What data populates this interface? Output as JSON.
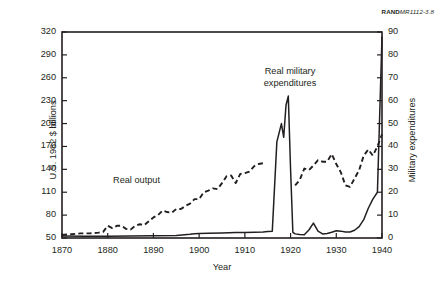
{
  "source_tag": {
    "bold": "RAND",
    "italic": "MR1112-3.8"
  },
  "chart_data": {
    "type": "line",
    "title": "",
    "xlabel": "Year",
    "ylabel": "U.S. 1982 $ billions",
    "y2label": "Military expenditures",
    "xlim": [
      1870,
      1940
    ],
    "ylim": [
      50,
      320
    ],
    "y2lim": [
      0,
      90
    ],
    "xticks": [
      1870,
      1880,
      1890,
      1900,
      1910,
      1920,
      1930,
      1940
    ],
    "yticks": [
      50,
      80,
      110,
      140,
      170,
      200,
      230,
      260,
      290,
      320
    ],
    "y2ticks": [
      0,
      10,
      20,
      30,
      40,
      50,
      60,
      70,
      80,
      90
    ],
    "grid": false,
    "legend": "annotations",
    "annotations": [
      {
        "text": "Real military expenditures",
        "line1": "Real military",
        "line2": "expenditures",
        "series": "real_military_expenditures"
      },
      {
        "text": "Real output",
        "line1": "Real output",
        "line2": "",
        "series": "real_output"
      }
    ],
    "series": [
      {
        "name": "Real output",
        "axis": "left",
        "style": "dashed",
        "units": "U.S. 1982 $ billions",
        "segments": [
          {
            "x": [
              1870,
              1872,
              1874,
              1876,
              1878,
              1879,
              1880,
              1881,
              1882,
              1883,
              1884,
              1885,
              1886,
              1887,
              1888,
              1889,
              1890,
              1891,
              1892,
              1893,
              1894,
              1895,
              1896,
              1897,
              1898,
              1899,
              1900,
              1901,
              1902,
              1903,
              1904,
              1905,
              1906,
              1907,
              1908,
              1909,
              1910,
              1911,
              1912,
              1913,
              1914
            ],
            "y": [
              54,
              55,
              56,
              56,
              57,
              58,
              66,
              63,
              66,
              66,
              62,
              61,
              66,
              68,
              67,
              72,
              77,
              80,
              86,
              84,
              83,
              88,
              88,
              92,
              95,
              101,
              101,
              110,
              112,
              115,
              114,
              122,
              131,
              132,
              122,
              134,
              135,
              137,
              144,
              147,
              148
            ]
          },
          {
            "x": [
              1921,
              1922,
              1923,
              1924,
              1925,
              1926,
              1927,
              1928,
              1929,
              1930,
              1931,
              1932,
              1933,
              1934,
              1935,
              1936,
              1937,
              1938,
              1939,
              1940
            ],
            "y": [
              119,
              126,
              141,
              139,
              145,
              152,
              150,
              150,
              160,
              147,
              136,
              119,
              117,
              128,
              139,
              158,
              166,
              158,
              170,
              186
            ]
          }
        ]
      },
      {
        "name": "Real military expenditures",
        "axis": "right",
        "style": "solid",
        "units": "billions",
        "segments": [
          {
            "x": [
              1870,
              1875,
              1880,
              1885,
              1890,
              1895,
              1898,
              1899,
              1900,
              1902,
              1905,
              1908,
              1910,
              1912,
              1914,
              1915,
              1916,
              1917,
              1918,
              1918.5,
              1919,
              1919.5,
              1920,
              1920.5,
              1921,
              1922,
              1923,
              1924,
              1925,
              1926,
              1927,
              1928,
              1929,
              1930,
              1931,
              1932,
              1933,
              1934,
              1935,
              1936,
              1937,
              1938,
              1939,
              1940
            ],
            "y": [
              0.9,
              0.8,
              0.8,
              0.9,
              1.0,
              1.1,
              1.6,
              1.9,
              2.0,
              2.1,
              2.2,
              2.4,
              2.4,
              2.5,
              2.6,
              2.8,
              3.0,
              42.0,
              50.0,
              44.0,
              58.0,
              62.0,
              30.0,
              2.5,
              1.8,
              1.5,
              1.4,
              3.5,
              6.5,
              3.0,
              1.8,
              2.0,
              2.5,
              3.2,
              3.0,
              2.6,
              2.6,
              3.4,
              5.0,
              8.0,
              13.0,
              17.0,
              20.0,
              88.0
            ]
          }
        ]
      }
    ]
  }
}
